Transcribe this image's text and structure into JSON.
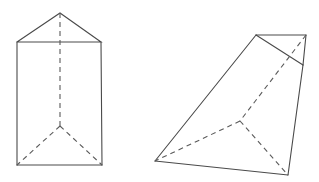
{
  "diagram": {
    "colors": {
      "line": "#4a4a4a",
      "background": "#ffffff"
    },
    "figures": [
      {
        "name": "triangular-prism",
        "vertices": {
          "top_apex": [
            60,
            13
          ],
          "top_left": [
            17,
            42
          ],
          "top_right": [
            101,
            42
          ],
          "bottom_left": [
            17,
            165
          ],
          "bottom_right": [
            102,
            165
          ],
          "bottom_back": [
            60,
            126
          ]
        }
      },
      {
        "name": "truncated-pyramid",
        "vertices": {
          "top_left": [
            256,
            35
          ],
          "top_right": [
            306,
            35
          ],
          "right_mid": [
            303,
            65
          ],
          "bottom_left": [
            155,
            161
          ],
          "bottom_right": [
            288,
            175
          ],
          "back": [
            240,
            121
          ]
        }
      }
    ]
  }
}
